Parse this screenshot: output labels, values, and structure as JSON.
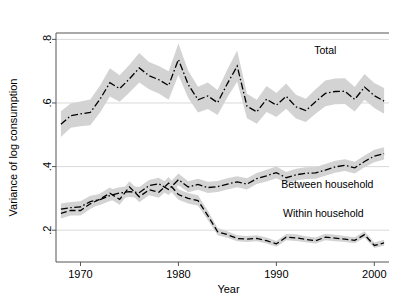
{
  "chart_data": {
    "type": "line",
    "title": "",
    "xlabel": "Year",
    "ylabel": "Variance of log consumption",
    "xlim": [
      1967.5,
      2001.5
    ],
    "ylim": [
      0.1,
      0.82
    ],
    "xticks": [
      1970,
      1980,
      1990,
      2000
    ],
    "xtick_labels": [
      "1970",
      "1980",
      "1990",
      "2000"
    ],
    "yticks": [
      0.2,
      0.4,
      0.6,
      0.8
    ],
    "ytick_labels": [
      ".2",
      ".4",
      ".6",
      ".8"
    ],
    "grid": "horizontal",
    "legend_position": "inline-annotations",
    "band_description": "shaded 95% confidence band around each series",
    "band_color": "#d3d3d3",
    "line_color": "#000000",
    "x": [
      1968,
      1969,
      1970,
      1971,
      1972,
      1973,
      1974,
      1975,
      1976,
      1977,
      1978,
      1979,
      1980,
      1981,
      1982,
      1983,
      1984,
      1985,
      1986,
      1987,
      1988,
      1989,
      1990,
      1991,
      1992,
      1993,
      1994,
      1995,
      1996,
      1997,
      1998,
      1999,
      2000,
      2001
    ],
    "series": [
      {
        "name": "Total",
        "label": "Total",
        "label_x": 1995.0,
        "label_y": 0.755,
        "linestyle": "dash-dot",
        "values": [
          0.533,
          0.56,
          0.566,
          0.57,
          0.612,
          0.664,
          0.645,
          0.676,
          0.71,
          0.686,
          0.673,
          0.655,
          0.737,
          0.658,
          0.61,
          0.622,
          0.601,
          0.661,
          0.716,
          0.59,
          0.572,
          0.612,
          0.593,
          0.621,
          0.588,
          0.576,
          0.604,
          0.63,
          0.636,
          0.637,
          0.611,
          0.65,
          0.623,
          0.606
        ],
        "lower": [
          0.493,
          0.522,
          0.527,
          0.53,
          0.57,
          0.62,
          0.604,
          0.633,
          0.664,
          0.643,
          0.63,
          0.61,
          0.688,
          0.616,
          0.57,
          0.581,
          0.562,
          0.618,
          0.667,
          0.552,
          0.535,
          0.572,
          0.556,
          0.582,
          0.551,
          0.54,
          0.566,
          0.59,
          0.596,
          0.597,
          0.573,
          0.61,
          0.584,
          0.566
        ],
        "upper": [
          0.574,
          0.598,
          0.605,
          0.611,
          0.655,
          0.709,
          0.687,
          0.72,
          0.757,
          0.729,
          0.716,
          0.7,
          0.787,
          0.701,
          0.651,
          0.664,
          0.641,
          0.705,
          0.765,
          0.629,
          0.61,
          0.653,
          0.631,
          0.661,
          0.626,
          0.613,
          0.643,
          0.671,
          0.677,
          0.678,
          0.65,
          0.691,
          0.663,
          0.647
        ]
      },
      {
        "name": "Between household",
        "label": "Between household",
        "label_x": 1995.2,
        "label_y": 0.333,
        "linestyle": "dash-dot",
        "values": [
          0.266,
          0.271,
          0.273,
          0.29,
          0.296,
          0.309,
          0.317,
          0.321,
          0.318,
          0.34,
          0.346,
          0.328,
          0.359,
          0.336,
          0.344,
          0.334,
          0.337,
          0.345,
          0.352,
          0.345,
          0.362,
          0.371,
          0.381,
          0.365,
          0.374,
          0.379,
          0.38,
          0.389,
          0.399,
          0.404,
          0.396,
          0.416,
          0.433,
          0.441
        ],
        "lower": [
          0.249,
          0.254,
          0.256,
          0.273,
          0.279,
          0.292,
          0.3,
          0.304,
          0.301,
          0.322,
          0.328,
          0.311,
          0.341,
          0.319,
          0.327,
          0.317,
          0.32,
          0.328,
          0.335,
          0.328,
          0.345,
          0.353,
          0.363,
          0.348,
          0.356,
          0.361,
          0.362,
          0.371,
          0.381,
          0.386,
          0.378,
          0.398,
          0.414,
          0.422
        ],
        "upper": [
          0.284,
          0.289,
          0.291,
          0.308,
          0.314,
          0.327,
          0.335,
          0.339,
          0.336,
          0.358,
          0.365,
          0.346,
          0.378,
          0.354,
          0.362,
          0.352,
          0.355,
          0.363,
          0.37,
          0.363,
          0.38,
          0.39,
          0.4,
          0.383,
          0.393,
          0.398,
          0.399,
          0.408,
          0.418,
          0.423,
          0.415,
          0.435,
          0.453,
          0.461
        ]
      },
      {
        "name": "Within household",
        "label": "Within household",
        "label_x": 1994.8,
        "label_y": 0.243,
        "linestyle": "dashed",
        "values": [
          0.253,
          0.262,
          0.262,
          0.283,
          0.298,
          0.316,
          0.297,
          0.336,
          0.305,
          0.327,
          0.319,
          0.348,
          0.312,
          0.3,
          0.293,
          0.246,
          0.195,
          0.186,
          0.174,
          0.172,
          0.174,
          0.167,
          0.157,
          0.178,
          0.176,
          0.171,
          0.167,
          0.178,
          0.175,
          0.172,
          0.168,
          0.186,
          0.152,
          0.16
        ],
        "lower": [
          0.237,
          0.246,
          0.246,
          0.267,
          0.282,
          0.299,
          0.28,
          0.319,
          0.288,
          0.31,
          0.302,
          0.33,
          0.296,
          0.284,
          0.277,
          0.232,
          0.184,
          0.176,
          0.165,
          0.163,
          0.165,
          0.158,
          0.148,
          0.168,
          0.166,
          0.162,
          0.158,
          0.168,
          0.165,
          0.163,
          0.159,
          0.176,
          0.144,
          0.151
        ],
        "upper": [
          0.27,
          0.279,
          0.279,
          0.3,
          0.315,
          0.334,
          0.315,
          0.354,
          0.323,
          0.345,
          0.337,
          0.367,
          0.329,
          0.317,
          0.31,
          0.261,
          0.207,
          0.197,
          0.184,
          0.182,
          0.184,
          0.177,
          0.166,
          0.188,
          0.187,
          0.181,
          0.177,
          0.189,
          0.186,
          0.182,
          0.178,
          0.197,
          0.161,
          0.17
        ]
      }
    ]
  },
  "axes": {
    "y_title": "Variance of log consumption",
    "x_title": "Year"
  }
}
